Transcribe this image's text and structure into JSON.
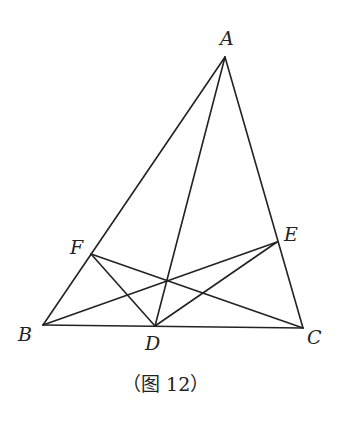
{
  "figure": {
    "caption": "（图 12）",
    "points": {
      "A": {
        "label": "A",
        "x": 225,
        "y": 57
      },
      "B": {
        "label": "B",
        "x": 43,
        "y": 325
      },
      "C": {
        "label": "C",
        "x": 303,
        "y": 328
      },
      "D": {
        "label": "D",
        "x": 155,
        "y": 326
      },
      "E": {
        "label": "E",
        "x": 277,
        "y": 242
      },
      "F": {
        "label": "F",
        "x": 91,
        "y": 254
      }
    },
    "segments": [
      "AB",
      "AC",
      "BC",
      "AD",
      "BE",
      "CF",
      "FD",
      "DE"
    ]
  }
}
